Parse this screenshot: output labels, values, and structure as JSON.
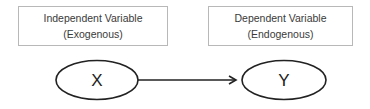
{
  "boxes": {
    "independent": {
      "line1": "Independent Variable",
      "line2": "(Exogenous)"
    },
    "dependent": {
      "line1": "Dependent Variable",
      "line2": "(Endogenous)"
    }
  },
  "nodes": {
    "x": {
      "label": "X"
    },
    "y": {
      "label": "Y"
    }
  },
  "edges": [
    {
      "from": "X",
      "to": "Y",
      "type": "directed-arrow"
    }
  ],
  "colors": {
    "box_border": "#b8b8b8",
    "stroke": "#222222",
    "text": "#3a3a3a"
  }
}
